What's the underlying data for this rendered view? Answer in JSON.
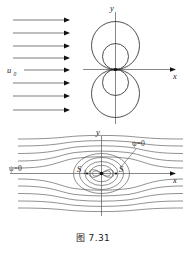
{
  "figure": {
    "caption": "图 7.31",
    "panels": [
      {
        "id": "upper",
        "name": "doublet-flow-circles",
        "axis_x_label": "x",
        "axis_y_label": "y",
        "flow_label": "u",
        "flow_label_sub": "0",
        "arrow_count": 8,
        "circle_count": 4
      },
      {
        "id": "lower",
        "name": "rankine-oval-streamlines",
        "axis_x_label": "x",
        "axis_y_label": "y",
        "stagnation_points": [
          {
            "label": "S",
            "sub": "1"
          },
          {
            "label": "S",
            "sub": "2"
          }
        ],
        "psi_label_left": "ψ=0",
        "psi_label_right": "ψ=0"
      }
    ],
    "colors": {
      "ink": "#1a1a1a",
      "line": "#555555",
      "curve": "#222222",
      "background": "#ffffff"
    }
  }
}
